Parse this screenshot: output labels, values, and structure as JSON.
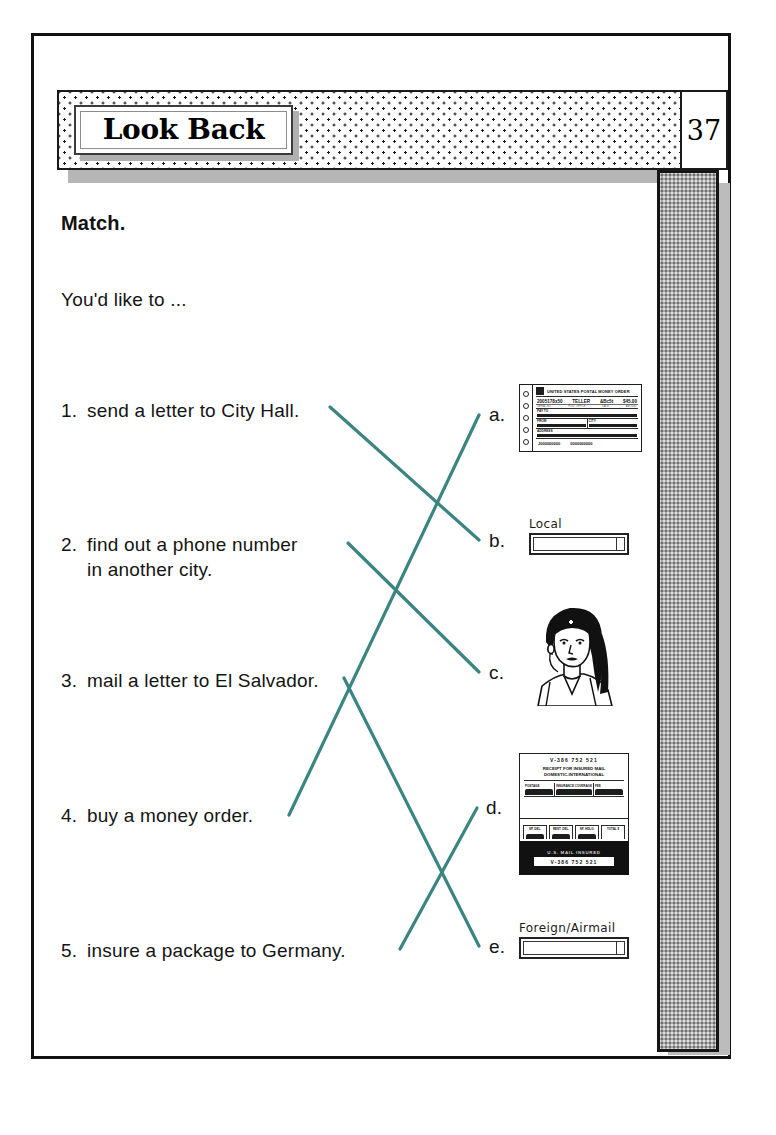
{
  "page": {
    "header_title": "Look Back",
    "page_number": "37"
  },
  "instructions": {
    "heading": "Match.",
    "subprompt": "You'd like to ..."
  },
  "prompts": [
    {
      "number": "1.",
      "text": "send a letter to City Hall."
    },
    {
      "number": "2.",
      "text": "find out a phone number\nin another city."
    },
    {
      "number": "3.",
      "text": "mail a letter to El Salvador."
    },
    {
      "number": "4.",
      "text": "buy a money order."
    },
    {
      "number": "5.",
      "text": "insure a package to Germany."
    }
  ],
  "answers": [
    {
      "letter": "a.",
      "image": "postal-money-order"
    },
    {
      "letter": "b.",
      "image": "local-mail-slot"
    },
    {
      "letter": "c.",
      "image": "telephone-operator"
    },
    {
      "letter": "d.",
      "image": "insured-mail-receipt"
    },
    {
      "letter": "e.",
      "image": "foreign-airmail-slot"
    }
  ],
  "artwork": {
    "money_order": {
      "title": "UNITED STATES POSTAL MONEY ORDER",
      "data_row": [
        "2005178x50",
        "TELLER",
        "&Bc5t",
        "$45.00"
      ],
      "caption_row": [
        "SERIAL NO.",
        "POST OFFICE",
        "DATE",
        "AMOUNT"
      ],
      "pay_to_label": "PAY TO",
      "from_label": "FROM",
      "address_label": "ADDRESS",
      "city_label": "CITY",
      "state_label": "STATE",
      "footer": [
        "J000000000",
        "0000000000"
      ]
    },
    "local_slot": {
      "label": "Local"
    },
    "foreign_slot": {
      "label": "Foreign/Airmail"
    },
    "insured_receipt": {
      "number_top": "V-386 752 521",
      "heading_line1": "RECEIPT FOR INSURED MAIL",
      "heading_line2": "DOMESTIC-INTERNATIONAL",
      "grid_cells": [
        "POSTAGE",
        "INSURANCE COVERAGE",
        "FEE"
      ],
      "mid_cells": [
        "SP. DEL.",
        "REST. DEL.",
        "SP. HDLG.",
        "TOTAL $"
      ],
      "black_band_text": "U.S. MAIL INSURED",
      "number_bottom": "V-386 752 521"
    },
    "operator": {
      "alt": "line drawing of a telephone operator with headset"
    }
  },
  "connections": [
    {
      "from": "1",
      "to": "b"
    },
    {
      "from": "2",
      "to": "c"
    },
    {
      "from": "3",
      "to": "e"
    },
    {
      "from": "4",
      "to": "a"
    },
    {
      "from": "5",
      "to": "d"
    }
  ],
  "colors": {
    "connector_line": "#3a8581",
    "ink": "#141414",
    "sidebar_gray": "#a9a9a9"
  }
}
